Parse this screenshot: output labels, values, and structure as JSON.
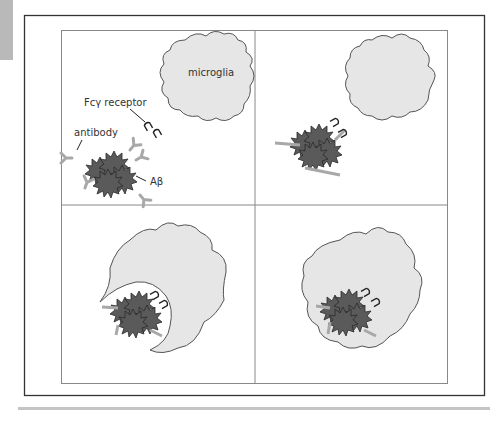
{
  "figure": {
    "panels": [
      {
        "id": 1,
        "stage": "antibody-opsonized Aβ approaching microglia"
      },
      {
        "id": 2,
        "stage": "Fcγ receptor binding to antibody-bound Aβ"
      },
      {
        "id": 3,
        "stage": "microglia engulfing Aβ aggregate"
      },
      {
        "id": 4,
        "stage": "Aβ internalized within microglia"
      }
    ],
    "labels": {
      "microglia": "microglia",
      "receptor": "Fcγ receptor",
      "antibody": "antibody",
      "amyloid": "Aβ"
    },
    "colors": {
      "microglia_fill": "#e6e6e6",
      "microglia_stroke": "#555555",
      "amyloid_fill": "#5a5a5a",
      "antibody": "#a8a8a8",
      "receptor": "#222222",
      "frame": "#333333",
      "grid": "#888888"
    }
  }
}
